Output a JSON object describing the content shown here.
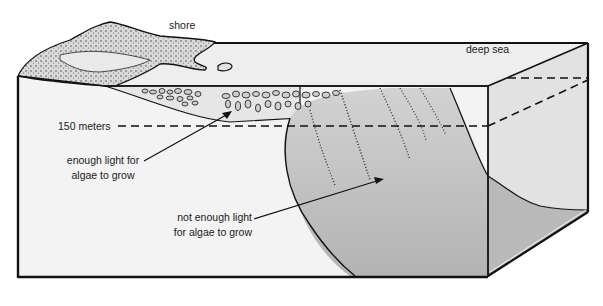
{
  "diagram": {
    "labels": {
      "shore": "shore",
      "deep_sea": "deep sea",
      "depth_line": "150 meters",
      "light_zone_line1": "enough light for",
      "light_zone_line2": "algae to grow",
      "dark_zone_line1": "not enough light",
      "dark_zone_line2": "for algae to grow"
    },
    "colors": {
      "outline": "#111111",
      "water_light": "#f1f1f1",
      "water_shaded": "#e3e3e3",
      "slope": "#c9c9c9",
      "slope_deep": "#b6b6b6",
      "land": "#d8d8d8",
      "background": "#ffffff"
    }
  }
}
